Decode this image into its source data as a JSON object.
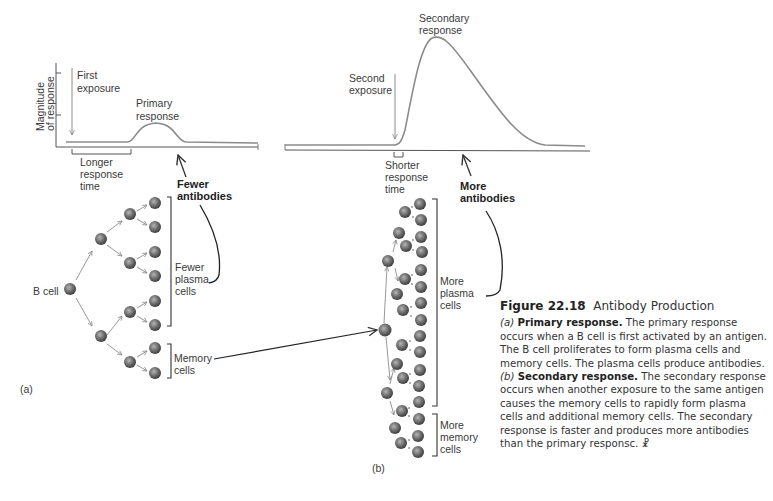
{
  "figure": {
    "number": "Figure 22.18",
    "title": "Antibody Production"
  },
  "graph_a": {
    "y_axis_label_line1": "Magnitude",
    "y_axis_label_line2": "of response",
    "first_exposure_line1": "First",
    "first_exposure_line2": "exposure",
    "peak_label_line1": "Primary",
    "peak_label_line2": "response",
    "time_bracket_line1": "Longer",
    "time_bracket_line2": "response",
    "time_bracket_line3": "time",
    "antibodies_line1": "Fewer",
    "antibodies_line2": "antibodies"
  },
  "graph_b": {
    "second_exposure_line1": "Second",
    "second_exposure_line2": "exposure",
    "peak_label_line1": "Secondary",
    "peak_label_line2": "response",
    "time_bracket_line1": "Shorter",
    "time_bracket_line2": "response",
    "time_bracket_line3": "time",
    "antibodies_line1": "More",
    "antibodies_line2": "antibodies"
  },
  "panel_a": {
    "label": "(a)",
    "b_cell_label": "B cell",
    "plasma_line1": "Fewer",
    "plasma_line2": "plasma",
    "plasma_line3": "cells",
    "memory_line1": "Memory",
    "memory_line2": "cells"
  },
  "panel_b": {
    "label": "(b)",
    "plasma_line1": "More",
    "plasma_line2": "plasma",
    "plasma_line3": "cells",
    "memory_line1": "More",
    "memory_line2": "memory",
    "memory_line3": "cells"
  },
  "caption": {
    "a_letter": "(a)",
    "a_title": "Primary response.",
    "a_text": "The primary response occurs when a B cell is first activated by an antigen. The B cell proliferates to form plasma cells and memory cells. The plasma cells produce antibodies.",
    "b_letter": "(b)",
    "b_title": "Secondary response.",
    "b_text": "The secondary response occurs when another exposure to the same antigen causes the memory cells to rapidly form plasma cells and additional memory cells. The secondary response is faster and produces more antibodies than the primary responsc.",
    "icon_glyph": "☧"
  },
  "colors": {
    "curve": "#8a8a8a",
    "axis": "#555555",
    "cell_dark": "#3f3f3f",
    "cell_light": "#9a9a9a",
    "arrow": "#8c8c8c",
    "text": "#333333"
  }
}
